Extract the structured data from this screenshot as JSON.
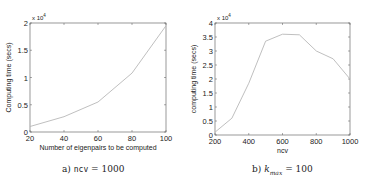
{
  "chart_data": [
    {
      "type": "line",
      "title": "",
      "xlabel": "Number of eigenpairs to be computed",
      "ylabel": "Computing time (secs)",
      "y_exponent": "x 10^4",
      "x": [
        20,
        40,
        60,
        80,
        100
      ],
      "series": [
        {
          "name": "ncv = 1000",
          "values": [
            0.1,
            0.28,
            0.55,
            1.08,
            1.95
          ]
        }
      ],
      "xlim": [
        20,
        100
      ],
      "ylim": [
        0,
        2
      ],
      "xticks": [
        20,
        40,
        60,
        80,
        100
      ],
      "yticks": [
        0,
        0.5,
        1,
        1.5,
        2
      ],
      "ytick_labels": [
        "0",
        "0.5",
        "1",
        "1.5",
        "2"
      ],
      "grid": false,
      "caption": {
        "prefix": "a)",
        "var": "ncv",
        "eq": "= 1000"
      }
    },
    {
      "type": "line",
      "title": "",
      "xlabel": "ncv",
      "ylabel": "computing time (secs)",
      "y_exponent": "x 10^4",
      "x": [
        200,
        300,
        400,
        500,
        600,
        700,
        800,
        900,
        1000
      ],
      "series": [
        {
          "name": "kmax = 100",
          "values": [
            0.1,
            0.6,
            1.85,
            3.35,
            3.6,
            3.58,
            3.0,
            2.72,
            2.0
          ]
        }
      ],
      "xlim": [
        200,
        1000
      ],
      "ylim": [
        0,
        4
      ],
      "xticks": [
        200,
        400,
        600,
        800,
        1000
      ],
      "yticks": [
        0,
        0.5,
        1,
        1.5,
        2,
        2.5,
        3,
        3.5,
        4
      ],
      "ytick_labels": [
        "0",
        "0.5",
        "1",
        "1.5",
        "2",
        "2.5",
        "3",
        "3.5",
        "4"
      ],
      "grid": false,
      "caption": {
        "prefix": "b)",
        "var": "k",
        "sub": "max",
        "eq": "= 100"
      }
    }
  ],
  "style": {
    "line_color": "#b8b8b8",
    "axis_color": "#555555"
  }
}
